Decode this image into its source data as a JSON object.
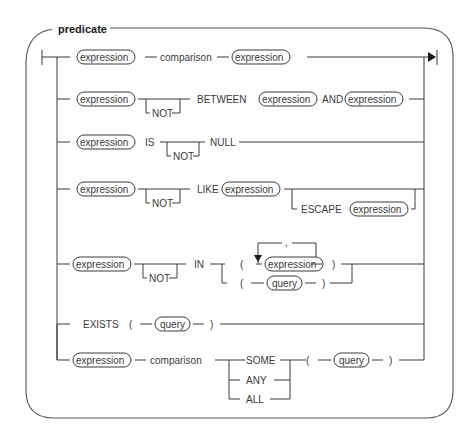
{
  "diagram": {
    "title": "predicate",
    "labels": {
      "expression": "expression",
      "comparison": "comparison",
      "not": "NOT",
      "between": "BETWEEN",
      "and": "AND",
      "is": "IS",
      "null": "NULL",
      "like": "LIKE",
      "escape": "ESCAPE",
      "in": "IN",
      "open_paren": "(",
      "close_paren": ")",
      "comma": ",",
      "query": "query",
      "exists": "EXISTS",
      "some": "SOME",
      "any": "ANY",
      "all": "ALL"
    },
    "rows": [
      {
        "name": "comparison-predicate",
        "tokens": [
          "expression",
          "comparison",
          "expression"
        ]
      },
      {
        "name": "between-predicate",
        "tokens": [
          "expression",
          "[NOT]",
          "BETWEEN",
          "expression",
          "AND",
          "expression"
        ]
      },
      {
        "name": "null-predicate",
        "tokens": [
          "expression",
          "IS",
          "[NOT]",
          "NULL"
        ]
      },
      {
        "name": "like-predicate",
        "tokens": [
          "expression",
          "[NOT]",
          "LIKE",
          "expression",
          "[ESCAPE expression]"
        ]
      },
      {
        "name": "in-predicate",
        "tokens": [
          "expression",
          "[NOT]",
          "IN",
          "( expression {, expression} ) | ( query )"
        ]
      },
      {
        "name": "exists-predicate",
        "tokens": [
          "EXISTS",
          "(",
          "query",
          ")"
        ]
      },
      {
        "name": "quantified-predicate",
        "tokens": [
          "expression",
          "comparison",
          "SOME|ANY|ALL",
          "(",
          "query",
          ")"
        ]
      }
    ]
  }
}
